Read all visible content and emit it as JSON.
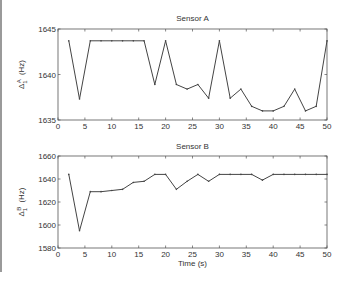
{
  "chart_data": [
    {
      "type": "line",
      "title": "Sensor A",
      "xlabel": "",
      "ylabel": "Δ1A (Hz)",
      "ylabel_main": "Δ",
      "ylabel_sub": "1",
      "ylabel_sup": "A",
      "ylabel_unit": "(Hz)",
      "xlim": [
        0,
        50
      ],
      "ylim": [
        1635,
        1645
      ],
      "xticks": [
        0,
        5,
        10,
        15,
        20,
        25,
        30,
        35,
        40,
        45,
        50
      ],
      "yticks": [
        1635,
        1640,
        1645
      ],
      "grid": false,
      "x": [
        2,
        4,
        6,
        8,
        10,
        12,
        14,
        16,
        18,
        20,
        22,
        24,
        26,
        28,
        30,
        32,
        34,
        36,
        38,
        40,
        42,
        44,
        46,
        48,
        50
      ],
      "values": [
        1643.7,
        1637.3,
        1643.7,
        1643.7,
        1643.7,
        1643.7,
        1643.7,
        1643.7,
        1638.9,
        1643.7,
        1638.9,
        1638.4,
        1638.9,
        1637.4,
        1643.7,
        1637.4,
        1638.4,
        1636.5,
        1636.0,
        1636.0,
        1636.5,
        1638.4,
        1636.0,
        1636.5,
        1643.7
      ]
    },
    {
      "type": "line",
      "title": "Sensor B",
      "xlabel": "Time (s)",
      "ylabel": "Δ1B (Hz)",
      "ylabel_main": "Δ",
      "ylabel_sub": "1",
      "ylabel_sup": "B",
      "ylabel_unit": "(Hz)",
      "xlim": [
        0,
        50
      ],
      "ylim": [
        1580,
        1660
      ],
      "xticks": [
        0,
        5,
        10,
        15,
        20,
        25,
        30,
        35,
        40,
        45,
        50
      ],
      "yticks": [
        1580,
        1600,
        1620,
        1640,
        1660
      ],
      "grid": false,
      "x": [
        2,
        4,
        6,
        8,
        10,
        12,
        14,
        16,
        18,
        20,
        22,
        24,
        26,
        28,
        30,
        32,
        34,
        36,
        38,
        40,
        42,
        44,
        46,
        48,
        50
      ],
      "values": [
        1644,
        1595,
        1629,
        1629,
        1630,
        1631,
        1637,
        1638,
        1644,
        1644,
        1631,
        1638,
        1644,
        1638,
        1644,
        1644,
        1644,
        1644,
        1639,
        1644,
        1644,
        1644,
        1644,
        1644,
        1644
      ]
    }
  ],
  "colors": {
    "line": "#444444",
    "axis": "#555555",
    "border": "#9a9a9a"
  }
}
